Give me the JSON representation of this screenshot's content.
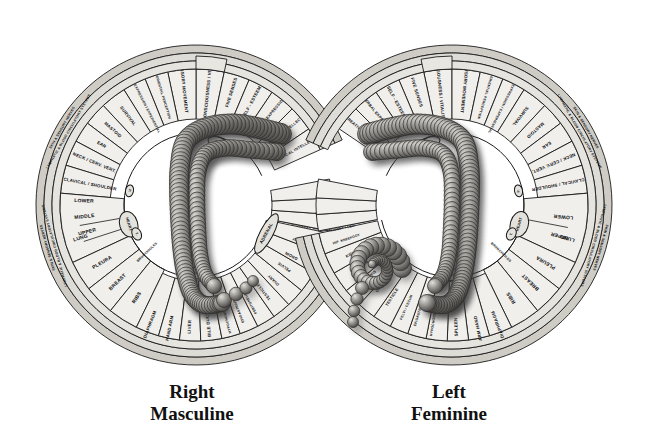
{
  "figure": {
    "type": "anatomical-reflexology-wheel",
    "palette": {
      "background": "#ffffff",
      "wedge_fill": "#f0efec",
      "ring_fill": "#dedcd7",
      "rim_fill": "#cfccc6",
      "stroke": "#1a1a1a",
      "text": "#0c0c0c",
      "colon_light": "#cfcdc8",
      "colon_mid": "#8e8c88",
      "colon_dark": "#4a4946"
    }
  },
  "captions": {
    "left": {
      "line1": "Right",
      "line2": "Masculine"
    },
    "right": {
      "line1": "Left",
      "line2": "Feminine"
    }
  },
  "rings": {
    "outer_band": "SKIN & SENSORY NERVES",
    "second_band": "LYMPHATIC & BLOOD CIRCULATORY SYSTEMS"
  },
  "glands": {
    "pituitary": "PIT.",
    "pineal": "P.",
    "thyroid": "T.",
    "heart": "HEART",
    "adrenal": "ADRENAL",
    "spleen_small": "SPL.",
    "pancreas": "PANCREAS",
    "gall": "GALL",
    "thymus": "TH."
  },
  "wheels": [
    {
      "id": "right-masculine",
      "side": "left-of-image",
      "caption_line1": "Right",
      "caption_line2": "Masculine",
      "sectors_upper": [
        "CONSCIOUSNESS / VITALITY",
        "SENSORY MOVEMENT",
        "EXPERIENTIAL PERCEPTION",
        "SEXUAL EXPRESSION / EXPERIENTIAL",
        "SURVIVAL",
        "MASTOID",
        "EAR",
        "NECK / CERV. VERT.",
        "CLAVICAL / SHOULDER"
      ],
      "sectors_upper_right": [
        "FIVE SENSES",
        "SELF - ESTEEM",
        "VERBAL EXPRESSION",
        "CREATIVE INTELLECT",
        "LOGICAL INTELLECT"
      ],
      "sectors_middle": [
        "UPPER",
        "MIDDLE",
        "LOWER",
        "LUNG",
        "PLEURA",
        "BREAST",
        "RIBS"
      ],
      "sectors_lower": [
        "DIAPHRAGM",
        "HAND  ARM",
        "LIVER",
        "BILE DUCT",
        "HYPOCHONDRIUM",
        "EPIGASTRIUM",
        "PERITONEUM",
        "TESTICLE",
        "OVARY",
        "PELVIS",
        "GROIN",
        "KIDNEY",
        "HIP",
        "KNEE",
        "FOOT",
        "KIDNEY / LEG",
        "KIDNEY"
      ],
      "inner_labels": [
        "BRONCHIOLES",
        "HEART",
        "T.",
        "P.",
        "PIT.",
        "ADRENAL",
        "GALL",
        "PANCREAS"
      ]
    },
    {
      "id": "left-feminine",
      "side": "right-of-image",
      "caption_line1": "Left",
      "caption_line2": "Feminine",
      "sectors_upper": [
        "CONSCIOUSNESS / VITALITY",
        "SENSORY MOVEMENT",
        "EXPERIENTIAL PERCEPTION",
        "SEXUAL EXPRESSION / EXPERIENTIAL",
        "SURVIVAL",
        "MASTOID",
        "EAR",
        "NECK / CERV. VERT.",
        "CLAVICAL / SHOULDER"
      ],
      "sectors_upper_left": [
        "FIVE SENSES",
        "SELF - ESTEEM",
        "VERBAL EXPRESSION",
        "CREATIVE INTELLECT"
      ],
      "sectors_middle": [
        "UPPER",
        "LOWER",
        "LUNG",
        "PLEURA",
        "BREAST",
        "RIBS"
      ],
      "sectors_lower": [
        "DIAPHRAGM",
        "ARM  HAND",
        "SPLEEN",
        "HYPOCHONDRIUM",
        "EPIGASTRIUM",
        "PELVI / CECUM",
        "TESTICLE",
        "OVARY",
        "PELVIS",
        "GROIN",
        "KIDNEY",
        "HIP",
        "KNEE",
        "FOOT",
        "KIDNEY / LEG",
        "RECTUM",
        "SIGMOID FLEXURE",
        "ANUS"
      ],
      "inner_labels": [
        "BRONCHIOLES",
        "HEART",
        "T.",
        "P.",
        "PIT.",
        "SPL."
      ]
    }
  ]
}
